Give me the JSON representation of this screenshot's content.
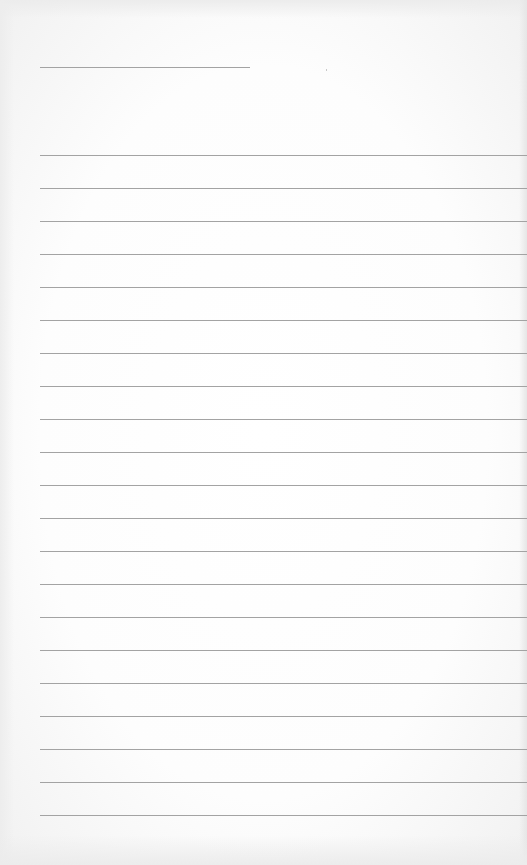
{
  "page": {
    "type": "lined-notebook-page",
    "background_color": "#ffffff",
    "line_color": "#a3a3a3",
    "header_line": {
      "left": 40,
      "top": 67,
      "width": 210
    },
    "ruled_lines": {
      "count": 21,
      "first_top": 155,
      "spacing": 33,
      "left": 40
    },
    "text": []
  }
}
